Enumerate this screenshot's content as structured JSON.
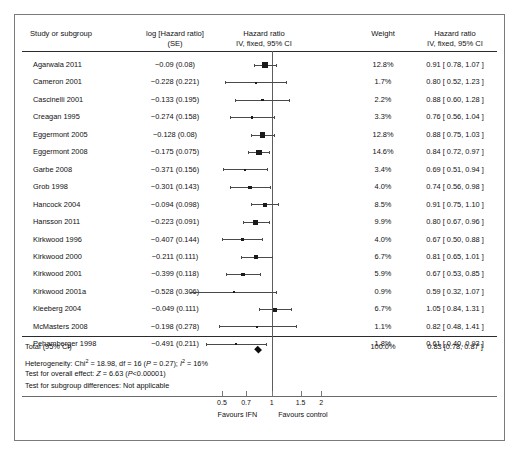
{
  "header": {
    "col_study": "Study or subgroup",
    "col_log_l1": "log [Hazard ratio]",
    "col_log_l2": "(SE)",
    "col_plot_l1": "Hazard ratio",
    "col_plot_l2": "IV, fixed, 95% CI",
    "col_weight": "Weight",
    "col_hr_l1": "Hazard ratio",
    "col_hr_l2": "IV, fixed, 95% CI"
  },
  "axis": {
    "ticks": [
      "0.5",
      "0.7",
      "1",
      "1.5",
      "2"
    ],
    "tick_values": [
      0.5,
      0.7,
      1,
      1.5,
      2
    ],
    "favours_left": "Favours IFN",
    "favours_right": "Favours control",
    "scale": "log",
    "xmin": 0.32,
    "xmax": 2.6
  },
  "total": {
    "label": "Total (95% CI)",
    "weight": "100.0%",
    "hr": "0.83 [0.78, 0.87 ]",
    "estimate": 0.83,
    "ci_low": 0.78,
    "ci_high": 0.87
  },
  "stats": [
    "Heterogeneity: Chi² = 18.98, df = 16 (P = 0.27); I² = 16%",
    "Test for overall effect: Z = 6.63 (P<0.00001)",
    "Test for subgroup differences: Not applicable"
  ],
  "chart_data": {
    "type": "forest",
    "title": "Hazard ratio",
    "subtitle": "IV, fixed, 95% CI",
    "xlabel": "Hazard ratio",
    "xscale": "log",
    "xlim": [
      0.32,
      2.6
    ],
    "null_value": 1,
    "studies": [
      {
        "study": "Agarwala 2011",
        "log_se": "−0.09 (0.08)",
        "log": -0.09,
        "se": 0.08,
        "weight": "12.8%",
        "weight_value": 12.8,
        "hr": "0.91 [ 0.78, 1.07 ]",
        "estimate": 0.91,
        "ci_low": 0.78,
        "ci_high": 1.07
      },
      {
        "study": "Cameron 2001",
        "log_se": "−0.228 (0.221)",
        "log": -0.228,
        "se": 0.221,
        "weight": "1.7%",
        "weight_value": 1.7,
        "hr": "0.80 [ 0.52, 1.23 ]",
        "estimate": 0.8,
        "ci_low": 0.52,
        "ci_high": 1.23
      },
      {
        "study": "Cascinelli 2001",
        "log_se": "−0.133 (0.195)",
        "log": -0.133,
        "se": 0.195,
        "weight": "2.2%",
        "weight_value": 2.2,
        "hr": "0.88 [ 0.60, 1.28 ]",
        "estimate": 0.88,
        "ci_low": 0.6,
        "ci_high": 1.28
      },
      {
        "study": "Creagan 1995",
        "log_se": "−0.274 (0.158)",
        "log": -0.274,
        "se": 0.158,
        "weight": "3.3%",
        "weight_value": 3.3,
        "hr": "0.76 [ 0.56, 1.04 ]",
        "estimate": 0.76,
        "ci_low": 0.56,
        "ci_high": 1.04
      },
      {
        "study": "Eggermont 2005",
        "log_se": "−0.128 (0.08)",
        "log": -0.128,
        "se": 0.08,
        "weight": "12.8%",
        "weight_value": 12.8,
        "hr": "0.88 [ 0.75, 1.03 ]",
        "estimate": 0.88,
        "ci_low": 0.75,
        "ci_high": 1.03
      },
      {
        "study": "Eggermont 2008",
        "log_se": "−0.175 (0.075)",
        "log": -0.175,
        "se": 0.075,
        "weight": "14.6%",
        "weight_value": 14.6,
        "hr": "0.84 [ 0.72, 0.97 ]",
        "estimate": 0.84,
        "ci_low": 0.72,
        "ci_high": 0.97
      },
      {
        "study": "Garbe 2008",
        "log_se": "−0.371 (0.156)",
        "log": -0.371,
        "se": 0.156,
        "weight": "3.4%",
        "weight_value": 3.4,
        "hr": "0.69 [ 0.51, 0.94 ]",
        "estimate": 0.69,
        "ci_low": 0.51,
        "ci_high": 0.94
      },
      {
        "study": "Grob 1998",
        "log_se": "−0.301 (0.143)",
        "log": -0.301,
        "se": 0.143,
        "weight": "4.0%",
        "weight_value": 4.0,
        "hr": "0.74 [ 0.56, 0.98 ]",
        "estimate": 0.74,
        "ci_low": 0.56,
        "ci_high": 0.98
      },
      {
        "study": "Hancock 2004",
        "log_se": "−0.094 (0.098)",
        "log": -0.094,
        "se": 0.098,
        "weight": "8.5%",
        "weight_value": 8.5,
        "hr": "0.91 [ 0.75, 1.10 ]",
        "estimate": 0.91,
        "ci_low": 0.75,
        "ci_high": 1.1
      },
      {
        "study": "Hansson 2011",
        "log_se": "−0.223 (0.091)",
        "log": -0.223,
        "se": 0.091,
        "weight": "9.9%",
        "weight_value": 9.9,
        "hr": "0.80 [ 0.67, 0.96 ]",
        "estimate": 0.8,
        "ci_low": 0.67,
        "ci_high": 0.96
      },
      {
        "study": "Kirkwood 1996",
        "log_se": "−0.407 (0.144)",
        "log": -0.407,
        "se": 0.144,
        "weight": "4.0%",
        "weight_value": 4.0,
        "hr": "0.67 [ 0.50, 0.88 ]",
        "estimate": 0.67,
        "ci_low": 0.5,
        "ci_high": 0.88
      },
      {
        "study": "Kirkwood 2000",
        "log_se": "−0.211 (0.111)",
        "log": -0.211,
        "se": 0.111,
        "weight": "6.7%",
        "weight_value": 6.7,
        "hr": "0.81 [ 0.65, 1.01 ]",
        "estimate": 0.81,
        "ci_low": 0.65,
        "ci_high": 1.01
      },
      {
        "study": "Kirkwood 2001",
        "log_se": "−0.399 (0.118)",
        "log": -0.399,
        "se": 0.118,
        "weight": "5.9%",
        "weight_value": 5.9,
        "hr": "0.67 [ 0.53, 0.85 ]",
        "estimate": 0.67,
        "ci_low": 0.53,
        "ci_high": 0.85
      },
      {
        "study": "Kirkwood 2001a",
        "log_se": "−0.528 (0.306)",
        "log": -0.528,
        "se": 0.306,
        "weight": "0.9%",
        "weight_value": 0.9,
        "hr": "0.59 [ 0.32, 1.07 ]",
        "estimate": 0.59,
        "ci_low": 0.32,
        "ci_high": 1.07
      },
      {
        "study": "Kleeberg 2004",
        "log_se": "−0.049 (0.111)",
        "log": -0.049,
        "se": 0.111,
        "weight": "6.7%",
        "weight_value": 6.7,
        "hr": "1.05 [ 0.84, 1.31 ]",
        "estimate": 1.05,
        "ci_low": 0.84,
        "ci_high": 1.31
      },
      {
        "study": "McMasters 2008",
        "log_se": "−0.198 (0.278)",
        "log": -0.198,
        "se": 0.278,
        "weight": "1.1%",
        "weight_value": 1.1,
        "hr": "0.82 [ 0.48, 1.41 ]",
        "estimate": 0.82,
        "ci_low": 0.48,
        "ci_high": 1.41
      },
      {
        "study": "Pehamberger 1998",
        "log_se": "−0.491 (0.211)",
        "log": -0.491,
        "se": 0.211,
        "weight": "1.8%",
        "weight_value": 1.8,
        "hr": "0.61 [ 0.40, 0.93 ]",
        "estimate": 0.61,
        "ci_low": 0.4,
        "ci_high": 0.93
      }
    ],
    "total": {
      "label": "Total (95% CI)",
      "weight": "100.0%",
      "estimate": 0.83,
      "ci_low": 0.78,
      "ci_high": 0.87,
      "hr": "0.83 [0.78, 0.87 ]"
    }
  }
}
